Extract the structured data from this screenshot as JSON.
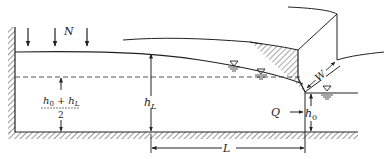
{
  "diagram": {
    "type": "hydraulics-cross-section",
    "labels": {
      "recharge": "N",
      "upstream_head": "h",
      "upstream_head_sub": "L",
      "average_head_num_a": "h",
      "average_head_num_a_sub": "0",
      "average_head_plus": "+",
      "average_head_num_b": "h",
      "average_head_num_b_sub": "L",
      "average_head_den": "2",
      "discharge": "Q",
      "downstream_head": "h",
      "downstream_head_sub": "0",
      "length": "L",
      "width": "W"
    },
    "colors": {
      "line": "#222222",
      "dashed": "#555555",
      "background": "#ffffff"
    },
    "recharge_arrows": 3,
    "water_table_symbols": 3
  }
}
